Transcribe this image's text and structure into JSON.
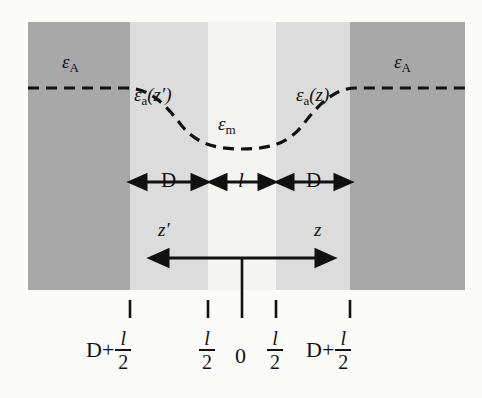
{
  "figure": {
    "type": "dielectric-slab-geometry-diagram",
    "background_color": "#fbfbfa",
    "colors": {
      "dark_band": "#a8a8a8",
      "light_band": "#dcdcdc",
      "white_band": "#f4f4f3",
      "line": "#111111"
    },
    "layout": {
      "band_top": 22,
      "band_bottom": 290,
      "band_edges": [
        28,
        130,
        208,
        276,
        350,
        465
      ],
      "band_fills": [
        "dark",
        "light",
        "white",
        "light",
        "dark"
      ],
      "baseline_y": 88,
      "curve_min_y": 148,
      "center_x": 242
    }
  },
  "curve": {
    "name": "dielectric-response-profile",
    "style": "dashed",
    "labels": {
      "left_plateau": {
        "symbol": "ε",
        "subscript": "A",
        "x": 70,
        "y": 60
      },
      "right_plateau": {
        "symbol": "ε",
        "subscript": "A",
        "x": 400,
        "y": 60
      },
      "left_slope": {
        "symbol": "ε",
        "subscript": "a",
        "argument": "(z′)",
        "x": 138,
        "y": 92
      },
      "right_slope": {
        "symbol": "ε",
        "subscript": "a",
        "argument": "(z)",
        "x": 300,
        "y": 92
      },
      "minimum": {
        "symbol": "ε",
        "subscript": "m",
        "x": 222,
        "y": 118
      }
    }
  },
  "dimensions": {
    "row_y": 182,
    "items": [
      {
        "label": "D",
        "italic": false,
        "x1": 130,
        "x2": 208
      },
      {
        "label": "l",
        "italic": true,
        "x1": 208,
        "x2": 276
      },
      {
        "label": "D",
        "italic": false,
        "x1": 276,
        "x2": 350
      }
    ]
  },
  "axis": {
    "name": "z-coordinate-axis",
    "arrow_y": 258,
    "x_left": 152,
    "x_right": 332,
    "origin_x": 242,
    "origin_tick_bottom": 300,
    "left_label": "z′",
    "right_label": "z",
    "left_label_x": 160,
    "right_label_x": 312,
    "label_y": 228
  },
  "ticks": {
    "y_top": 300,
    "y_bottom": 318,
    "positions": [
      130,
      208,
      242,
      276,
      350
    ]
  },
  "tick_labels": [
    {
      "id": "tick-label-left-outer",
      "prefix": "D+",
      "numerator": "l",
      "denominator": "2",
      "center_x": 130
    },
    {
      "id": "tick-label-left-inner",
      "prefix": "",
      "numerator": "l",
      "denominator": "2",
      "center_x": 208
    },
    {
      "id": "tick-label-origin",
      "prefix": "0",
      "numerator": "",
      "denominator": "",
      "center_x": 242
    },
    {
      "id": "tick-label-right-inner",
      "prefix": "",
      "numerator": "l",
      "denominator": "2",
      "center_x": 276
    },
    {
      "id": "tick-label-right-outer",
      "prefix": "D+",
      "numerator": "l",
      "denominator": "2",
      "center_x": 350
    }
  ]
}
